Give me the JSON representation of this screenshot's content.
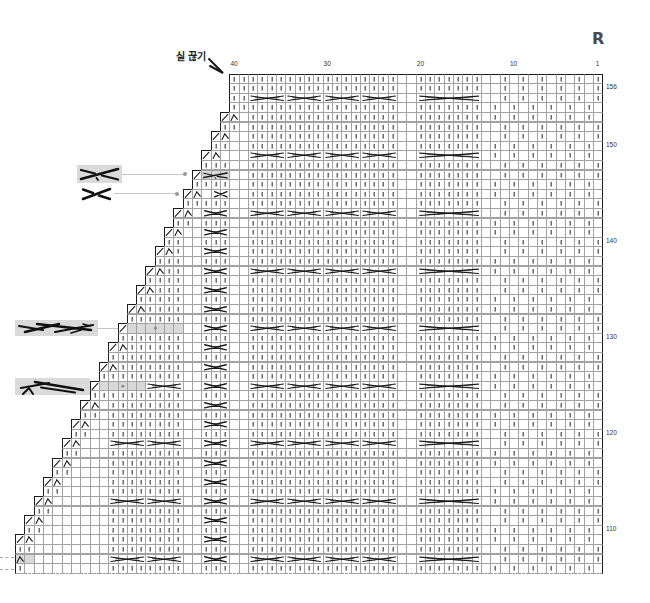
{
  "chart": {
    "side_label": "R",
    "note": {
      "text": "실 끊기",
      "icon": "arrow-icon"
    },
    "column_labels": [
      {
        "col": 40,
        "text": "40"
      },
      {
        "col": 30,
        "text": "30"
      },
      {
        "col": 20,
        "text": "20"
      },
      {
        "col": 10,
        "text": "10"
      },
      {
        "col": 1,
        "text": "1"
      }
    ],
    "row_labels": [
      {
        "row": 156,
        "text": "156"
      },
      {
        "row": 150,
        "text": "150"
      },
      {
        "row": 140,
        "text": "140"
      },
      {
        "row": 130,
        "text": "130"
      },
      {
        "row": 120,
        "text": "120"
      },
      {
        "row": 110,
        "text": "110"
      }
    ],
    "colors": {
      "ink": "#1a1a1a",
      "grid_line": "#a2a2a2",
      "edge": "#1c1c1c",
      "highlight": "#d9d9d9",
      "leader": "#c6c6c6",
      "dot": "#8c8c8c"
    },
    "symbols": {
      "|": {
        "name": "knit-cell",
        "icon": "knit-stitch-icon"
      },
      ".": {
        "name": "purl-cell",
        "icon": ""
      },
      "/": {
        "name": "k2tog-cell",
        "icon": "k2tog-icon"
      },
      "^": {
        "name": "decrease-cell",
        "icon": "decrease-icon"
      },
      "g": {
        "name": "highlight-cell",
        "icon": ""
      },
      "h": {
        "name": "highlight-decrease-cell",
        "icon": "decrease-icon"
      },
      "-": {
        "name": "cable-span-cell",
        "icon": ""
      },
      "=": {
        "name": "highlight-span-cell",
        "icon": ""
      },
      "A": {
        "name": "cable-4st",
        "icon": "cable-4st-icon"
      },
      "B": {
        "name": "cable-7st",
        "icon": "cable-7st-icon"
      },
      "C": {
        "name": "cross-3st",
        "icon": "cross-3st-icon"
      },
      "D": {
        "name": "cross-2st",
        "icon": "cross-2st-icon"
      },
      "E": {
        "name": "cross-3st-highlight",
        "icon": "cross-3st-highlight-icon"
      },
      "H": {
        "name": "cable-highlight",
        "icon": "highlight-dot-icon"
      }
    },
    "grid": {
      "columns": 63,
      "first_row": 157,
      "last_row": 106,
      "tails": {
        "nO": "||||||||||||||||..|||||||..|.|.|.|.|.|",
        "nE": "||||||||||||||||..|||||||.|.|.|.|.|.|.",
        "cO": "A---A---A---A---..B------..|.|.|.|.|.|",
        "cE": "A---A---A---A---..B------.|.|.|.|.|.|."
      },
      "rows": [
        {
          "row": 157,
          "offset": 23,
          "lead": "||",
          "tail": "nO"
        },
        {
          "row": 156,
          "offset": 23,
          "lead": "||",
          "tail": "nO"
        },
        {
          "row": 155,
          "offset": 23,
          "lead": "||",
          "tail": "cO"
        },
        {
          "row": 154,
          "offset": 23,
          "lead": "||",
          "tail": "nE"
        },
        {
          "row": 153,
          "offset": 22,
          "lead": "/^.",
          "tail": "nE"
        },
        {
          "row": 152,
          "offset": 22,
          "lead": "||.",
          "tail": "nO"
        },
        {
          "row": 151,
          "offset": 21,
          "lead": "/^..",
          "tail": "nO"
        },
        {
          "row": 150,
          "offset": 21,
          "lead": "||..",
          "tail": "nE"
        },
        {
          "row": 149,
          "offset": 20,
          "lead": "/^...",
          "tail": "cE"
        },
        {
          "row": 148,
          "offset": 20,
          "lead": "|||..",
          "tail": "nO"
        },
        {
          "row": 147,
          "offset": 19,
          "lead": "/E==..",
          "tail": "nO"
        },
        {
          "row": 146,
          "offset": 19,
          "lead": "||||..",
          "tail": "nE"
        },
        {
          "row": 145,
          "offset": 18,
          "lead": "/^.D-..",
          "tail": "nE"
        },
        {
          "row": 144,
          "offset": 18,
          "lead": "|||||..",
          "tail": "nO"
        },
        {
          "row": 143,
          "offset": 17,
          "lead": "/^.C--..",
          "tail": "cO"
        },
        {
          "row": 142,
          "offset": 17,
          "lead": "||.|||..",
          "tail": "nE"
        },
        {
          "row": 141,
          "offset": 16,
          "lead": "/^..C--..",
          "tail": "nE"
        },
        {
          "row": 140,
          "offset": 16,
          "lead": "||..|||..",
          "tail": "nO"
        },
        {
          "row": 139,
          "offset": 15,
          "lead": "/^|..C--..",
          "tail": "nO"
        },
        {
          "row": 138,
          "offset": 15,
          "lead": "|||..|||..",
          "tail": "nE"
        },
        {
          "row": 137,
          "offset": 14,
          "lead": "/^||..C--..",
          "tail": "cE"
        },
        {
          "row": 136,
          "offset": 14,
          "lead": "||||..|||..",
          "tail": "nO"
        },
        {
          "row": 135,
          "offset": 13,
          "lead": "/^|||..C--..",
          "tail": "nO"
        },
        {
          "row": 134,
          "offset": 13,
          "lead": "|||||..|||..",
          "tail": "nE"
        },
        {
          "row": 133,
          "offset": 12,
          "lead": "/^||||..C--..",
          "tail": "nE"
        },
        {
          "row": 132,
          "offset": 12,
          "lead": "||||||..|||..",
          "tail": "nO"
        },
        {
          "row": 131,
          "offset": 11,
          "lead": "/H=====..C--..",
          "tail": "cO"
        },
        {
          "row": 130,
          "offset": 11,
          "lead": "|||||||..|||..",
          "tail": "nE"
        },
        {
          "row": 129,
          "offset": 10,
          "lead": "/^||||||..C--..",
          "tail": "nE"
        },
        {
          "row": 128,
          "offset": 10,
          "lead": "||||||||..|||..",
          "tail": "nO"
        },
        {
          "row": 127,
          "offset": 9,
          "lead": "/^|||||||..C--..",
          "tail": "nO"
        },
        {
          "row": 126,
          "offset": 9,
          "lead": "|||||||||..|||..",
          "tail": "nE"
        },
        {
          "row": 125,
          "offset": 8,
          "lead": "/H====A---..C--..",
          "tail": "cE"
        },
        {
          "row": 124,
          "offset": 8,
          "lead": "||||||||||..|||..",
          "tail": "nO"
        },
        {
          "row": 123,
          "offset": 7,
          "lead": "/^.||||||||..C--..",
          "tail": "nO"
        },
        {
          "row": 122,
          "offset": 7,
          "lead": "||.||||||||..|||..",
          "tail": "nE"
        },
        {
          "row": 121,
          "offset": 6,
          "lead": "/^..||||||||..C--..",
          "tail": "nE"
        },
        {
          "row": 120,
          "offset": 6,
          "lead": "||..||||||||..|||..",
          "tail": "nO"
        },
        {
          "row": 119,
          "offset": 5,
          "lead": "/^...A---A---..C--..",
          "tail": "cO"
        },
        {
          "row": 118,
          "offset": 5,
          "lead": "||...||||||||..|||..",
          "tail": "nE"
        },
        {
          "row": 117,
          "offset": 4,
          "lead": "/^....||||||||..C--..",
          "tail": "nE"
        },
        {
          "row": 116,
          "offset": 4,
          "lead": "||....||||||||..|||..",
          "tail": "nO"
        },
        {
          "row": 115,
          "offset": 3,
          "lead": "/^.....||||||||..C--..",
          "tail": "nO"
        },
        {
          "row": 114,
          "offset": 3,
          "lead": "||.....||||||||..|||..",
          "tail": "nE"
        },
        {
          "row": 113,
          "offset": 2,
          "lead": "/^......A---A---..C--..",
          "tail": "cE"
        },
        {
          "row": 112,
          "offset": 2,
          "lead": "||......||||||||..|||..",
          "tail": "nO"
        },
        {
          "row": 111,
          "offset": 1,
          "lead": "/^.......||||||||..C--..",
          "tail": "nO"
        },
        {
          "row": 110,
          "offset": 1,
          "lead": "||.......||||||||..|||..",
          "tail": "nE"
        },
        {
          "row": 109,
          "offset": 0,
          "lead": "/^........||||||||..C--..",
          "tail": "nE"
        },
        {
          "row": 108,
          "offset": 0,
          "lead": "||........||||||||..|||..",
          "tail": "nO"
        },
        {
          "row": 107,
          "offset": 0,
          "lead": "hg........A---A---..C--..",
          "tail": "cO"
        },
        {
          "row": 106,
          "offset": 0,
          "lead": "|.........||||||||..|||..",
          "tail": "nE"
        }
      ]
    },
    "callouts": [
      {
        "symbol": "cross-3st-highlight",
        "row": 147
      },
      {
        "symbol": "cross-2st",
        "row": 145
      },
      {
        "symbol": "cable-6st-highlight",
        "row": 131
      },
      {
        "symbol": "cable-5st-highlight",
        "row": 125
      }
    ]
  }
}
